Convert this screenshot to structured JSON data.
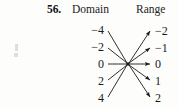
{
  "header": {
    "exercise_number": "56.",
    "domain_heading": "Domain",
    "range_heading": "Range"
  },
  "diagram": {
    "type": "mapping-diagram",
    "hub": {
      "x": 128,
      "y": 64
    },
    "domain_values": [
      "−4",
      "−2",
      "0",
      "2",
      "4"
    ],
    "range_values": [
      "−2",
      "−1",
      "0",
      "1",
      "2"
    ],
    "domain_nodes": [
      {
        "label": "−4",
        "x": 104,
        "y": 30
      },
      {
        "label": "−2",
        "x": 104,
        "y": 47
      },
      {
        "label": "0",
        "x": 104,
        "y": 64
      },
      {
        "label": "2",
        "x": 104,
        "y": 81
      },
      {
        "label": "4",
        "x": 104,
        "y": 98
      }
    ],
    "range_nodes": [
      {
        "label": "−2",
        "x": 155,
        "y": 31
      },
      {
        "label": "−1",
        "x": 155,
        "y": 48
      },
      {
        "label": "0",
        "x": 155,
        "y": 64
      },
      {
        "label": "1",
        "x": 155,
        "y": 81
      },
      {
        "label": "2",
        "x": 155,
        "y": 98
      }
    ],
    "edges_in": [
      {
        "from": "−4",
        "x1": 108,
        "y1": 31,
        "x2": 127,
        "y2": 63
      },
      {
        "from": "−2",
        "x1": 108,
        "y1": 48,
        "x2": 127,
        "y2": 63
      },
      {
        "from": "0",
        "x1": 108,
        "y1": 64,
        "x2": 127,
        "y2": 64
      },
      {
        "from": "2",
        "x1": 108,
        "y1": 80,
        "x2": 127,
        "y2": 65
      },
      {
        "from": "4",
        "x1": 108,
        "y1": 97,
        "x2": 127,
        "y2": 65
      }
    ],
    "edges_out": [
      {
        "to": "−2",
        "x1": 129,
        "y1": 63,
        "x2": 150,
        "y2": 31
      },
      {
        "to": "−1",
        "x1": 129,
        "y1": 63,
        "x2": 150,
        "y2": 48
      },
      {
        "to": "0",
        "x1": 129,
        "y1": 64,
        "x2": 150,
        "y2": 64
      },
      {
        "to": "1",
        "x1": 129,
        "y1": 65,
        "x2": 150,
        "y2": 80
      },
      {
        "to": "2",
        "x1": 129,
        "y1": 65,
        "x2": 150,
        "y2": 97
      }
    ],
    "colors": {
      "ink": "#1a1a1a",
      "background": "#fdfdfc"
    }
  }
}
